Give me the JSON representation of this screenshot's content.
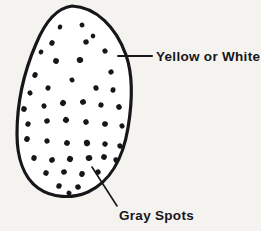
{
  "diagram": {
    "background_color": "#f5f3f0",
    "ink_color": "#17171a",
    "shell": {
      "name": "egg-outline",
      "fill": "#ffffff",
      "stroke": "#17171a",
      "stroke_width": 3.2,
      "bounds": {
        "x_min": 17,
        "x_max": 131,
        "y_min": 6,
        "y_max": 196
      }
    },
    "callouts": [
      {
        "id": "shell-color",
        "label": "Yellow or White",
        "leader": {
          "type": "horizontal",
          "x1": 118,
          "y1": 56,
          "x2": 152,
          "y2": 56
        },
        "text_x": 156,
        "text_y": 61
      },
      {
        "id": "spots",
        "label": "Gray Spots",
        "leader": {
          "type": "diagonal",
          "x1": 92,
          "y1": 167,
          "x2": 117,
          "y2": 206
        },
        "text_x": 119,
        "text_y": 220
      }
    ],
    "spots": {
      "name": "gray-spots",
      "color": "#17171a",
      "count": 47,
      "points": [
        {
          "x": 60,
          "y": 27,
          "rx": 2.2,
          "ry": 2.6,
          "rot": 14
        },
        {
          "x": 82,
          "y": 25,
          "rx": 2.4,
          "ry": 2.4,
          "rot": -20
        },
        {
          "x": 52,
          "y": 43,
          "rx": 2.6,
          "ry": 2.8,
          "rot": 30
        },
        {
          "x": 86,
          "y": 42,
          "rx": 2.8,
          "ry": 2.6,
          "rot": -10
        },
        {
          "x": 41,
          "y": 52,
          "rx": 2.3,
          "ry": 2.5,
          "rot": 40
        },
        {
          "x": 105,
          "y": 51,
          "rx": 2.5,
          "ry": 2.7,
          "rot": -30
        },
        {
          "x": 56,
          "y": 61,
          "rx": 2.9,
          "ry": 2.8,
          "rot": 18
        },
        {
          "x": 80,
          "y": 60,
          "rx": 3.2,
          "ry": 3.0,
          "rot": -8
        },
        {
          "x": 35,
          "y": 75,
          "rx": 2.6,
          "ry": 2.9,
          "rot": 25
        },
        {
          "x": 111,
          "y": 72,
          "rx": 2.7,
          "ry": 2.5,
          "rot": -35
        },
        {
          "x": 24,
          "y": 109,
          "rx": 2.8,
          "ry": 2.9,
          "rot": 12
        },
        {
          "x": 44,
          "y": 106,
          "rx": 2.5,
          "ry": 2.6,
          "rot": -18
        },
        {
          "x": 63,
          "y": 103,
          "rx": 2.9,
          "ry": 3.1,
          "rot": 33
        },
        {
          "x": 83,
          "y": 102,
          "rx": 3.0,
          "ry": 2.8,
          "rot": -22
        },
        {
          "x": 101,
          "y": 105,
          "rx": 2.6,
          "ry": 2.7,
          "rot": 16
        },
        {
          "x": 119,
          "y": 107,
          "rx": 2.7,
          "ry": 2.9,
          "rot": -28
        },
        {
          "x": 28,
          "y": 124,
          "rx": 2.6,
          "ry": 2.8,
          "rot": 22
        },
        {
          "x": 47,
          "y": 121,
          "rx": 2.8,
          "ry": 2.6,
          "rot": -14
        },
        {
          "x": 66,
          "y": 120,
          "rx": 3.0,
          "ry": 3.0,
          "rot": 38
        },
        {
          "x": 86,
          "y": 122,
          "rx": 2.7,
          "ry": 2.8,
          "rot": -26
        },
        {
          "x": 105,
          "y": 124,
          "rx": 2.9,
          "ry": 2.7,
          "rot": 10
        },
        {
          "x": 122,
          "y": 126,
          "rx": 2.5,
          "ry": 2.6,
          "rot": -32
        },
        {
          "x": 27,
          "y": 139,
          "rx": 2.8,
          "ry": 3.0,
          "rot": 20
        },
        {
          "x": 47,
          "y": 141,
          "rx": 2.6,
          "ry": 2.7,
          "rot": -16
        },
        {
          "x": 67,
          "y": 143,
          "rx": 2.9,
          "ry": 2.8,
          "rot": 28
        },
        {
          "x": 87,
          "y": 143,
          "rx": 3.1,
          "ry": 3.2,
          "rot": -12
        },
        {
          "x": 105,
          "y": 144,
          "rx": 2.7,
          "ry": 2.6,
          "rot": 34
        },
        {
          "x": 120,
          "y": 146,
          "rx": 2.6,
          "ry": 2.8,
          "rot": -24
        },
        {
          "x": 34,
          "y": 158,
          "rx": 2.7,
          "ry": 2.9,
          "rot": 15
        },
        {
          "x": 52,
          "y": 160,
          "rx": 2.9,
          "ry": 2.7,
          "rot": -30
        },
        {
          "x": 70,
          "y": 159,
          "rx": 3.0,
          "ry": 3.1,
          "rot": 24
        },
        {
          "x": 89,
          "y": 158,
          "rx": 3.3,
          "ry": 3.0,
          "rot": -18
        },
        {
          "x": 104,
          "y": 157,
          "rx": 2.8,
          "ry": 2.9,
          "rot": 36
        },
        {
          "x": 116,
          "y": 160,
          "rx": 2.6,
          "ry": 2.7,
          "rot": -10
        },
        {
          "x": 46,
          "y": 173,
          "rx": 2.7,
          "ry": 2.8,
          "rot": 26
        },
        {
          "x": 64,
          "y": 172,
          "rx": 2.9,
          "ry": 2.6,
          "rot": -20
        },
        {
          "x": 82,
          "y": 174,
          "rx": 2.8,
          "ry": 3.0,
          "rot": 12
        },
        {
          "x": 98,
          "y": 172,
          "rx": 2.6,
          "ry": 2.7,
          "rot": -34
        },
        {
          "x": 59,
          "y": 186,
          "rx": 2.7,
          "ry": 2.8,
          "rot": 18
        },
        {
          "x": 78,
          "y": 187,
          "rx": 2.8,
          "ry": 2.7,
          "rot": -22
        },
        {
          "x": 69,
          "y": 193,
          "rx": 2.5,
          "ry": 2.4,
          "rot": 30
        },
        {
          "x": 96,
          "y": 88,
          "rx": 2.6,
          "ry": 2.8,
          "rot": -15
        },
        {
          "x": 48,
          "y": 88,
          "rx": 2.5,
          "ry": 2.6,
          "rot": 21
        },
        {
          "x": 72,
          "y": 80,
          "rx": 2.4,
          "ry": 2.5,
          "rot": -27
        },
        {
          "x": 113,
          "y": 90,
          "rx": 2.5,
          "ry": 2.7,
          "rot": 11
        },
        {
          "x": 30,
          "y": 93,
          "rx": 2.4,
          "ry": 2.6,
          "rot": -31
        },
        {
          "x": 93,
          "y": 36,
          "rx": 2.3,
          "ry": 2.4,
          "rot": 17
        }
      ]
    }
  }
}
